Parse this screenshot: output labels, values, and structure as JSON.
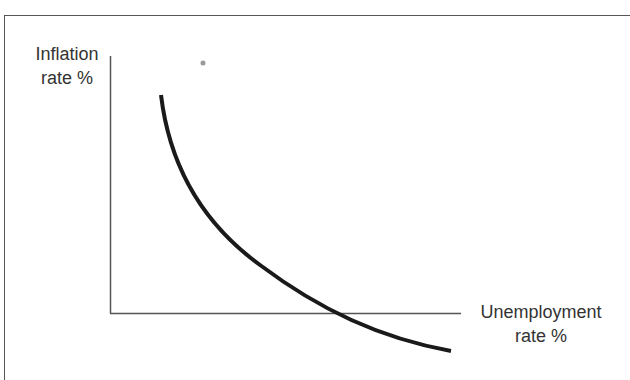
{
  "diagram": {
    "y_axis_label_line1": "Inflation",
    "y_axis_label_line2": "rate %",
    "x_axis_label_line1": "Unemployment",
    "x_axis_label_line2": "rate %",
    "colors": {
      "axis": "#555555",
      "curve": "#1a1a1a",
      "text": "#333333",
      "dot": "#999999"
    },
    "curve": {
      "description": "Downward-sloping convex curve (inverse relationship between inflation and unemployment)",
      "points_px": [
        [
          161,
          95
        ],
        [
          175,
          150
        ],
        [
          200,
          195
        ],
        [
          250,
          255
        ],
        [
          300,
          298
        ],
        [
          350,
          322
        ],
        [
          400,
          340
        ],
        [
          451,
          351
        ]
      ]
    }
  }
}
